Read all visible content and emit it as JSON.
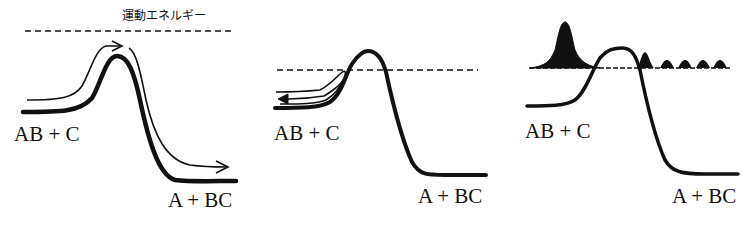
{
  "figure": {
    "panels": [
      {
        "id": "classical-over-barrier",
        "energy_label": "運動エネルギー",
        "reactant_label": "AB + C",
        "product_label": "A + BC"
      },
      {
        "id": "classical-reflection",
        "reactant_label": "AB + C",
        "product_label": "A + BC"
      },
      {
        "id": "quantum-tunneling",
        "reactant_label": "AB + C",
        "product_label": "A + BC"
      }
    ],
    "colors": {
      "ink": "#111111",
      "background": "#ffffff"
    }
  }
}
